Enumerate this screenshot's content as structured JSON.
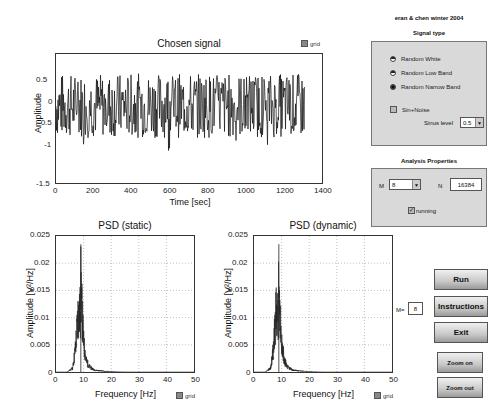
{
  "header": {
    "credits": "eran & chen winter 2004"
  },
  "signal_plot": {
    "title": "Chosen signal",
    "xlabel": "Time [sec]",
    "ylabel": "Amplitude",
    "xticks": [
      "0",
      "200",
      "400",
      "600",
      "800",
      "1000",
      "1200",
      "1400"
    ],
    "yticks": [
      "0.5",
      "0",
      "-0.5",
      "-1",
      "-1.5"
    ],
    "grid_label": "grid"
  },
  "psd_static": {
    "title": "PSD (static)",
    "xlabel": "Frequency [Hz]",
    "ylabel": "Amplitude [V²/Hz]",
    "xticks": [
      "0",
      "10",
      "20",
      "30",
      "40",
      "50"
    ],
    "yticks": [
      "0.025",
      "0.02",
      "0.015",
      "0.01",
      "0.005",
      "0"
    ],
    "grid_label": "grid"
  },
  "psd_dynamic": {
    "title": "PSD (dynamic)",
    "xlabel": "Frequency [Hz]",
    "ylabel": "Amplitude [V²/Hz]",
    "xticks": [
      "0",
      "10",
      "20",
      "30",
      "40",
      "50"
    ],
    "yticks": [
      "0.025",
      "0.02",
      "0.015",
      "0.01",
      "0.005",
      "0"
    ],
    "grid_label": "grid"
  },
  "signal_type": {
    "title": "Signal type",
    "options": [
      {
        "label": "Random White",
        "selected": false
      },
      {
        "label": "Random Low Band",
        "selected": false
      },
      {
        "label": "Random Narrow Band",
        "selected": true
      }
    ],
    "sin_noise_label": "Sin+Noise",
    "sin_noise_checked": false,
    "sinus_level_label": "Sinus level",
    "sinus_level_value": "0.5"
  },
  "analysis": {
    "title": "Analysis Properties",
    "m_label": "M",
    "m_value": "8",
    "n_label": "N",
    "n_value": "16384",
    "running_label": "running",
    "running_checked": true
  },
  "m_display": {
    "label": "M=",
    "value": "8"
  },
  "buttons": {
    "run": "Run",
    "instructions": "Instructions",
    "exit": "Exit",
    "zoom_on": "Zoom on",
    "zoom_out": "Zoom out"
  },
  "chart_data": [
    {
      "type": "line",
      "title": "Chosen signal",
      "xlabel": "Time [sec]",
      "ylabel": "Amplitude",
      "xlim": [
        0,
        1400
      ],
      "ylim": [
        -1.5,
        1
      ],
      "xticks": [
        0,
        200,
        400,
        600,
        800,
        1000,
        1200,
        1400
      ],
      "yticks": [
        -1.5,
        -1,
        -0.5,
        0,
        0.5
      ],
      "description": "Random narrow-band noise from 0 to ~1310 sec, amplitude mostly within ±0.6, peaks to ~0.85 and ~-1.2",
      "grid": false
    },
    {
      "type": "line",
      "title": "PSD (static)",
      "xlabel": "Frequency [Hz]",
      "ylabel": "Amplitude [V²/Hz]",
      "xlim": [
        0,
        50
      ],
      "ylim": [
        0,
        0.025
      ],
      "x": [
        0,
        4,
        6,
        7,
        8,
        8.5,
        9,
        10,
        11,
        12,
        14,
        18,
        25,
        50
      ],
      "values": [
        0,
        0,
        0.001,
        0.006,
        0.016,
        0.015,
        0.0235,
        0.008,
        0.003,
        0.0015,
        0.0005,
        0.0002,
        0,
        0
      ],
      "grid": true
    },
    {
      "type": "line",
      "title": "PSD (dynamic)",
      "xlabel": "Frequency [Hz]",
      "ylabel": "Amplitude [V²/Hz]",
      "xlim": [
        0,
        50
      ],
      "ylim": [
        0,
        0.025
      ],
      "x": [
        0,
        4,
        6,
        7,
        8,
        8.5,
        9,
        10,
        11,
        12,
        14,
        18,
        25,
        50
      ],
      "values": [
        0,
        0,
        0.001,
        0.006,
        0.016,
        0.015,
        0.0235,
        0.008,
        0.003,
        0.0015,
        0.0005,
        0.0002,
        0,
        0
      ],
      "grid": true
    }
  ]
}
